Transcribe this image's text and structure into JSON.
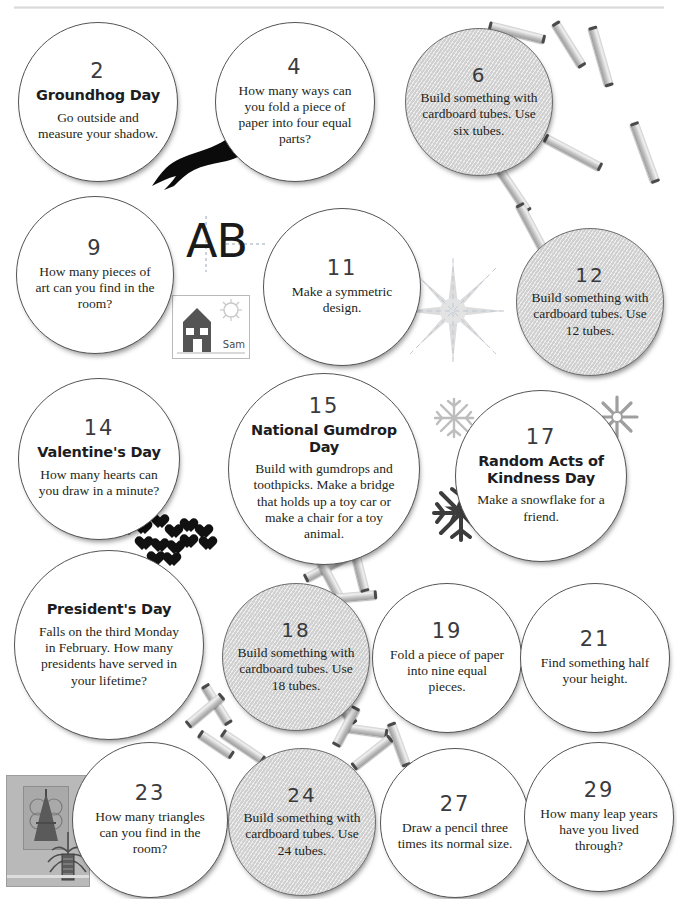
{
  "page": {
    "top_rule": "horizontal-rule"
  },
  "bubbles": [
    {
      "number": "2",
      "heading": "Groundhog Day",
      "body": "Go outside and measure your shadow.",
      "style": "white",
      "name": "bubble-day-2"
    },
    {
      "number": "4",
      "heading": "",
      "body": "How many ways can you fold a piece of paper into four equal parts?",
      "style": "white",
      "name": "bubble-day-4"
    },
    {
      "number": "6",
      "heading": "",
      "body": "Build something with cardboard tubes. Use six tubes.",
      "style": "gray",
      "name": "bubble-day-6"
    },
    {
      "number": "9",
      "heading": "",
      "body": "How many pieces of art can you find in the room?",
      "style": "white",
      "name": "bubble-day-9"
    },
    {
      "number": "11",
      "heading": "",
      "body": "Make a symmetric design.",
      "style": "white",
      "name": "bubble-day-11"
    },
    {
      "number": "12",
      "heading": "",
      "body": "Build something with cardboard tubes. Use 12 tubes.",
      "style": "gray",
      "name": "bubble-day-12"
    },
    {
      "number": "14",
      "heading": "Valentine's Day",
      "body": "How many hearts can you draw in a minute?",
      "style": "white",
      "name": "bubble-day-14"
    },
    {
      "number": "15",
      "heading": "National Gumdrop Day",
      "body": "Build with gumdrops and toothpicks. Make a bridge that holds up a toy car or make a chair for a toy animal.",
      "style": "white",
      "name": "bubble-day-15"
    },
    {
      "number": "17",
      "heading": "Random Acts of Kindness Day",
      "body": "Make a snowflake for a friend.",
      "style": "white",
      "name": "bubble-day-17"
    },
    {
      "number": "",
      "heading": "President's Day",
      "body": "Falls on the third Monday in February. How many presidents have served in your lifetime?",
      "style": "white",
      "name": "bubble-presidents-day"
    },
    {
      "number": "18",
      "heading": "",
      "body": "Build something with cardboard tubes. Use 18 tubes.",
      "style": "gray",
      "name": "bubble-day-18"
    },
    {
      "number": "19",
      "heading": "",
      "body": "Fold a piece of paper into nine equal pieces.",
      "style": "white",
      "name": "bubble-day-19"
    },
    {
      "number": "21",
      "heading": "",
      "body": "Find something half your height.",
      "style": "white",
      "name": "bubble-day-21"
    },
    {
      "number": "23",
      "heading": "",
      "body": "How many triangles can you find in the room?",
      "style": "white",
      "name": "bubble-day-23"
    },
    {
      "number": "24",
      "heading": "",
      "body": "Build something with cardboard tubes. Use 24 tubes.",
      "style": "gray",
      "name": "bubble-day-24"
    },
    {
      "number": "27",
      "heading": "",
      "body": "Draw a pencil three times its normal size.",
      "style": "white",
      "name": "bubble-day-27"
    },
    {
      "number": "29",
      "heading": "",
      "body": "How many leap years have you lived through?",
      "style": "white",
      "name": "bubble-day-29"
    }
  ],
  "decorations": {
    "groundhog": "groundhog-silhouette-icon",
    "ab_letters": "AB",
    "kid_drawing_signature": "Sam",
    "kid_drawing": "childs-house-drawing-icon",
    "hearts": "hearts-cluster-icon",
    "star_burst": "symmetric-starburst-icon",
    "snowflakes": "snowflake-icon",
    "pencil": "pencil-icon",
    "room_photo": "room-photo-icon",
    "tubes": "cardboard-tube-icon"
  },
  "colors": {
    "ink": "#231f20",
    "number": "#3b3b3d",
    "outline": "#555356",
    "gray_fill": "#d8d8d8",
    "tube": "#c8c8c8",
    "rule": "#d9d9d9"
  }
}
